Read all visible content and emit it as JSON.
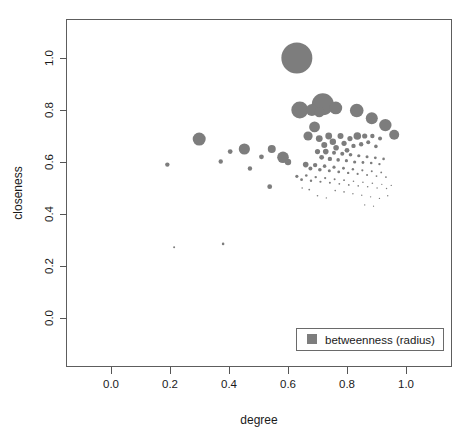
{
  "chart_data": {
    "type": "scatter",
    "title": "",
    "xlabel": "degree",
    "ylabel": "closeness",
    "xlim": [
      -0.06,
      1.08
    ],
    "ylim": [
      -0.08,
      1.12
    ],
    "grid": false,
    "size_encoding": "betweenness (radius)",
    "marker_color": "#7d7d7d",
    "xticks": [
      0.0,
      0.2,
      0.4,
      0.6,
      0.8,
      1.0
    ],
    "xtick_labels": [
      "0.0",
      "0.2",
      "0.4",
      "0.6",
      "0.8",
      "1.0"
    ],
    "yticks": [
      0.0,
      0.2,
      0.4,
      0.6,
      0.8,
      1.0
    ],
    "ytick_labels": [
      "0.0",
      "0.2",
      "0.4",
      "0.6",
      "0.8",
      "1.0"
    ],
    "legend": {
      "position": "bottom-right",
      "entries": [
        {
          "label": "betweenness (radius)",
          "marker": "square",
          "color": "#7d7d7d"
        }
      ]
    },
    "points": [
      {
        "x": 0.63,
        "y": 1.0,
        "r": 15.5
      },
      {
        "x": 0.718,
        "y": 0.822,
        "r": 11.0
      },
      {
        "x": 0.64,
        "y": 0.8,
        "r": 8.5
      },
      {
        "x": 0.681,
        "y": 0.8,
        "r": 6.0
      },
      {
        "x": 0.706,
        "y": 0.792,
        "r": 5.2
      },
      {
        "x": 0.762,
        "y": 0.808,
        "r": 6.4
      },
      {
        "x": 0.833,
        "y": 0.798,
        "r": 6.8
      },
      {
        "x": 0.884,
        "y": 0.768,
        "r": 6.0
      },
      {
        "x": 0.93,
        "y": 0.742,
        "r": 6.2
      },
      {
        "x": 0.96,
        "y": 0.705,
        "r": 5.0
      },
      {
        "x": 0.299,
        "y": 0.688,
        "r": 6.5
      },
      {
        "x": 0.452,
        "y": 0.65,
        "r": 5.6
      },
      {
        "x": 0.404,
        "y": 0.64,
        "r": 2.4
      },
      {
        "x": 0.372,
        "y": 0.602,
        "r": 2.2
      },
      {
        "x": 0.191,
        "y": 0.59,
        "r": 2.2
      },
      {
        "x": 0.545,
        "y": 0.65,
        "r": 4.0
      },
      {
        "x": 0.51,
        "y": 0.62,
        "r": 2.4
      },
      {
        "x": 0.583,
        "y": 0.618,
        "r": 5.8
      },
      {
        "x": 0.6,
        "y": 0.6,
        "r": 3.2
      },
      {
        "x": 0.471,
        "y": 0.575,
        "r": 2.2
      },
      {
        "x": 0.538,
        "y": 0.505,
        "r": 2.4
      },
      {
        "x": 0.668,
        "y": 0.7,
        "r": 4.6
      },
      {
        "x": 0.69,
        "y": 0.735,
        "r": 5.4
      },
      {
        "x": 0.706,
        "y": 0.69,
        "r": 3.4
      },
      {
        "x": 0.723,
        "y": 0.665,
        "r": 3.0
      },
      {
        "x": 0.738,
        "y": 0.7,
        "r": 3.4
      },
      {
        "x": 0.752,
        "y": 0.678,
        "r": 3.2
      },
      {
        "x": 0.763,
        "y": 0.655,
        "r": 2.8
      },
      {
        "x": 0.778,
        "y": 0.7,
        "r": 3.0
      },
      {
        "x": 0.79,
        "y": 0.672,
        "r": 2.6
      },
      {
        "x": 0.8,
        "y": 0.645,
        "r": 2.4
      },
      {
        "x": 0.81,
        "y": 0.69,
        "r": 2.6
      },
      {
        "x": 0.822,
        "y": 0.662,
        "r": 2.2
      },
      {
        "x": 0.835,
        "y": 0.7,
        "r": 3.8
      },
      {
        "x": 0.848,
        "y": 0.668,
        "r": 2.2
      },
      {
        "x": 0.86,
        "y": 0.7,
        "r": 2.6
      },
      {
        "x": 0.872,
        "y": 0.676,
        "r": 2.0
      },
      {
        "x": 0.886,
        "y": 0.7,
        "r": 2.2
      },
      {
        "x": 0.898,
        "y": 0.66,
        "r": 1.8
      },
      {
        "x": 0.912,
        "y": 0.69,
        "r": 2.0
      },
      {
        "x": 0.7,
        "y": 0.64,
        "r": 2.6
      },
      {
        "x": 0.714,
        "y": 0.618,
        "r": 2.4
      },
      {
        "x": 0.728,
        "y": 0.64,
        "r": 2.8
      },
      {
        "x": 0.742,
        "y": 0.612,
        "r": 2.2
      },
      {
        "x": 0.756,
        "y": 0.636,
        "r": 2.0
      },
      {
        "x": 0.77,
        "y": 0.608,
        "r": 1.8
      },
      {
        "x": 0.784,
        "y": 0.632,
        "r": 2.0
      },
      {
        "x": 0.798,
        "y": 0.605,
        "r": 1.6
      },
      {
        "x": 0.812,
        "y": 0.628,
        "r": 1.8
      },
      {
        "x": 0.826,
        "y": 0.6,
        "r": 1.6
      },
      {
        "x": 0.84,
        "y": 0.624,
        "r": 1.6
      },
      {
        "x": 0.854,
        "y": 0.598,
        "r": 1.4
      },
      {
        "x": 0.868,
        "y": 0.62,
        "r": 1.5
      },
      {
        "x": 0.882,
        "y": 0.596,
        "r": 1.3
      },
      {
        "x": 0.896,
        "y": 0.616,
        "r": 1.4
      },
      {
        "x": 0.91,
        "y": 0.592,
        "r": 1.2
      },
      {
        "x": 0.924,
        "y": 0.612,
        "r": 1.3
      },
      {
        "x": 0.66,
        "y": 0.59,
        "r": 2.8
      },
      {
        "x": 0.676,
        "y": 0.575,
        "r": 2.0
      },
      {
        "x": 0.692,
        "y": 0.588,
        "r": 2.2
      },
      {
        "x": 0.708,
        "y": 0.57,
        "r": 1.8
      },
      {
        "x": 0.724,
        "y": 0.584,
        "r": 1.8
      },
      {
        "x": 0.74,
        "y": 0.566,
        "r": 1.5
      },
      {
        "x": 0.756,
        "y": 0.58,
        "r": 1.6
      },
      {
        "x": 0.772,
        "y": 0.562,
        "r": 1.4
      },
      {
        "x": 0.788,
        "y": 0.576,
        "r": 1.4
      },
      {
        "x": 0.804,
        "y": 0.558,
        "r": 1.2
      },
      {
        "x": 0.82,
        "y": 0.572,
        "r": 1.2
      },
      {
        "x": 0.836,
        "y": 0.554,
        "r": 1.1
      },
      {
        "x": 0.852,
        "y": 0.568,
        "r": 1.1
      },
      {
        "x": 0.868,
        "y": 0.55,
        "r": 1.0
      },
      {
        "x": 0.884,
        "y": 0.564,
        "r": 1.0
      },
      {
        "x": 0.9,
        "y": 0.546,
        "r": 0.9
      },
      {
        "x": 0.916,
        "y": 0.56,
        "r": 0.9
      },
      {
        "x": 0.932,
        "y": 0.542,
        "r": 0.9
      },
      {
        "x": 0.63,
        "y": 0.545,
        "r": 1.6
      },
      {
        "x": 0.646,
        "y": 0.532,
        "r": 1.4
      },
      {
        "x": 0.662,
        "y": 0.548,
        "r": 1.3
      },
      {
        "x": 0.678,
        "y": 0.528,
        "r": 1.2
      },
      {
        "x": 0.694,
        "y": 0.542,
        "r": 1.2
      },
      {
        "x": 0.71,
        "y": 0.524,
        "r": 1.1
      },
      {
        "x": 0.726,
        "y": 0.538,
        "r": 1.1
      },
      {
        "x": 0.742,
        "y": 0.52,
        "r": 1.0
      },
      {
        "x": 0.758,
        "y": 0.534,
        "r": 1.0
      },
      {
        "x": 0.774,
        "y": 0.516,
        "r": 0.9
      },
      {
        "x": 0.79,
        "y": 0.53,
        "r": 0.9
      },
      {
        "x": 0.806,
        "y": 0.512,
        "r": 0.9
      },
      {
        "x": 0.822,
        "y": 0.526,
        "r": 0.8
      },
      {
        "x": 0.838,
        "y": 0.508,
        "r": 0.8
      },
      {
        "x": 0.854,
        "y": 0.522,
        "r": 0.8
      },
      {
        "x": 0.87,
        "y": 0.505,
        "r": 0.8
      },
      {
        "x": 0.886,
        "y": 0.518,
        "r": 0.8
      },
      {
        "x": 0.902,
        "y": 0.5,
        "r": 0.7
      },
      {
        "x": 0.918,
        "y": 0.514,
        "r": 0.7
      },
      {
        "x": 0.934,
        "y": 0.498,
        "r": 0.7
      },
      {
        "x": 0.95,
        "y": 0.51,
        "r": 0.7
      },
      {
        "x": 0.76,
        "y": 0.49,
        "r": 0.8
      },
      {
        "x": 0.79,
        "y": 0.485,
        "r": 0.8
      },
      {
        "x": 0.82,
        "y": 0.478,
        "r": 0.7
      },
      {
        "x": 0.85,
        "y": 0.472,
        "r": 0.7
      },
      {
        "x": 0.88,
        "y": 0.466,
        "r": 0.7
      },
      {
        "x": 0.91,
        "y": 0.46,
        "r": 0.7
      },
      {
        "x": 0.938,
        "y": 0.47,
        "r": 0.7
      },
      {
        "x": 0.7,
        "y": 0.47,
        "r": 0.8
      },
      {
        "x": 0.73,
        "y": 0.462,
        "r": 0.7
      },
      {
        "x": 0.672,
        "y": 0.494,
        "r": 0.9
      },
      {
        "x": 0.648,
        "y": 0.5,
        "r": 0.8
      },
      {
        "x": 0.86,
        "y": 0.435,
        "r": 0.7
      },
      {
        "x": 0.89,
        "y": 0.43,
        "r": 0.6
      },
      {
        "x": 0.214,
        "y": 0.272,
        "r": 1.0
      },
      {
        "x": 0.38,
        "y": 0.285,
        "r": 1.3
      }
    ]
  },
  "axes": {
    "x_title": "degree",
    "y_title": "closeness"
  }
}
